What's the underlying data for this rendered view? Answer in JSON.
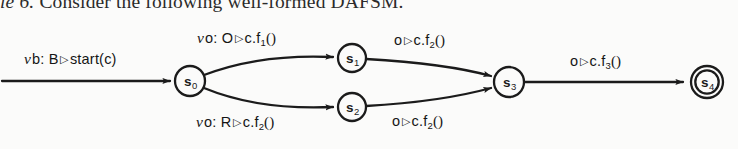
{
  "caption": {
    "prefix_italic": "le",
    "number": "6.",
    "text": "Consider the following well-formed DAFSM."
  },
  "figure": {
    "name": "dafsm-state-diagram",
    "background_color": "#fbfbfa",
    "stroke_color": "#1b1b1b",
    "states": [
      {
        "id": "s0",
        "label": "s",
        "sub": "0",
        "cx": 190,
        "cy": 81,
        "r": 15,
        "accepting": false
      },
      {
        "id": "s1",
        "label": "s",
        "sub": "1",
        "cx": 352,
        "cy": 58,
        "r": 14,
        "accepting": false
      },
      {
        "id": "s2",
        "label": "s",
        "sub": "2",
        "cx": 352,
        "cy": 107,
        "r": 14,
        "accepting": false
      },
      {
        "id": "s3",
        "label": "s",
        "sub": "3",
        "cx": 509,
        "cy": 82,
        "r": 15,
        "accepting": false
      },
      {
        "id": "s4",
        "label": "s",
        "sub": "4",
        "cx": 707,
        "cy": 82,
        "r": 16,
        "accepting": true
      }
    ],
    "transitions": [
      {
        "id": "start",
        "from": "(initial)",
        "to": "s0",
        "nu": "ν",
        "binder": "b:",
        "guard": "B",
        "triangle": "▷",
        "action": "start(c)",
        "action_sub": "",
        "paren": "",
        "label_x": 24,
        "label_y": 50
      },
      {
        "id": "s0-s1",
        "from": "s0",
        "to": "s1",
        "nu": "ν",
        "binder": "o:",
        "guard": "O",
        "triangle": "▷",
        "action": "c.f",
        "action_sub": "1",
        "paren": "()",
        "label_x": 197,
        "label_y": 29
      },
      {
        "id": "s0-s2",
        "from": "s0",
        "to": "s2",
        "nu": "ν",
        "binder": "o:",
        "guard": "R",
        "triangle": "▷",
        "action": "c.f",
        "action_sub": "2",
        "paren": "()",
        "label_x": 196,
        "label_y": 113
      },
      {
        "id": "s1-s3",
        "from": "s1",
        "to": "s3",
        "nu": "",
        "binder": "o",
        "guard": "",
        "triangle": "▷",
        "action": "c.f",
        "action_sub": "2",
        "paren": "()",
        "label_x": 394,
        "label_y": 32
      },
      {
        "id": "s2-s3",
        "from": "s2",
        "to": "s3",
        "nu": "",
        "binder": "o",
        "guard": "",
        "triangle": "▷",
        "action": "c.f",
        "action_sub": "2",
        "paren": "()",
        "label_x": 392,
        "label_y": 113
      },
      {
        "id": "s3-s4",
        "from": "s3",
        "to": "s4",
        "nu": "",
        "binder": "o",
        "guard": "",
        "triangle": "▷",
        "action": "c.f",
        "action_sub": "3",
        "paren": "()",
        "label_x": 570,
        "label_y": 53
      }
    ]
  }
}
